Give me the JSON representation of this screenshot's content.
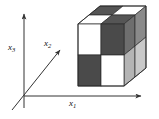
{
  "figure": {
    "name": "coordinate-axes-with-checkerboard-cube",
    "background": "#ffffff",
    "width": 159,
    "height": 119
  },
  "axes": {
    "stroke": "#333333",
    "origin": [
      24,
      96
    ],
    "items": [
      {
        "key": "x1",
        "label": "x",
        "index": "1",
        "kind": "horizontal-axis",
        "from": [
          24,
          96
        ],
        "to": [
          143,
          96
        ]
      },
      {
        "key": "x2",
        "label": "x",
        "index": "2",
        "kind": "diagonal-axis",
        "from": [
          12,
          110
        ],
        "to": [
          62,
          48
        ]
      },
      {
        "key": "x3",
        "label": "x",
        "index": "3",
        "kind": "vertical-axis",
        "from": [
          24,
          108
        ],
        "to": [
          24,
          12
        ]
      }
    ]
  },
  "cube": {
    "name": "checkerboard-cube",
    "divisions": 2,
    "colors": {
      "white": "#ffffff",
      "dark": "#4a4a4a",
      "top_dark": "#555555",
      "side_dark": "#6e6e6e",
      "side_light": "#b4b4b4",
      "edge": "#2b2b2b"
    },
    "front_face": {
      "name": "front-face",
      "tiles": [
        "white",
        "dark",
        "dark",
        "white"
      ]
    },
    "top_face": {
      "name": "top-face",
      "tiles": [
        "top_dark",
        "white",
        "white",
        "top_dark"
      ]
    },
    "right_face": {
      "name": "right-face",
      "tiles": [
        "side_dark",
        "side_light"
      ]
    }
  }
}
